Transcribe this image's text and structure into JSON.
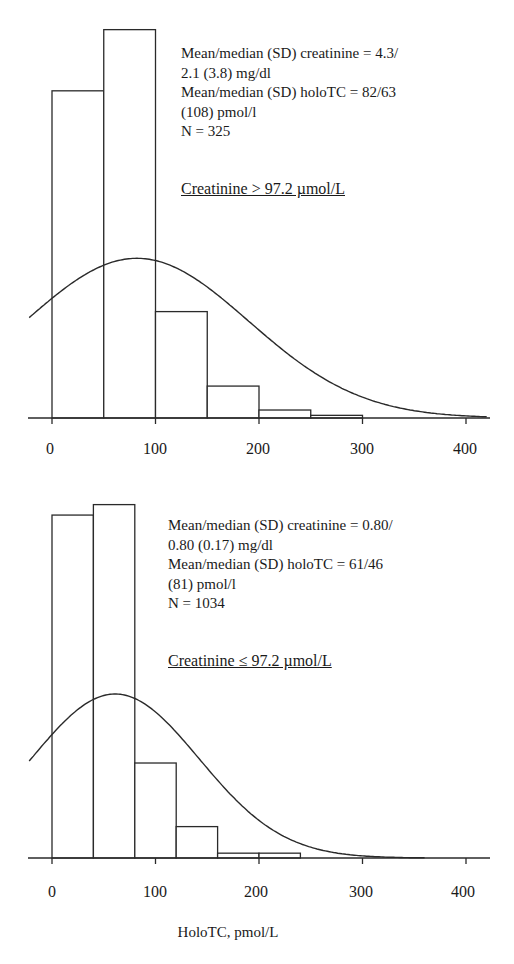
{
  "chart_data": [
    {
      "type": "bar",
      "subtype": "histogram_with_normal_curve",
      "title": "Creatinine > 97.2 µmol/L",
      "xlabel": "",
      "ylabel": "",
      "xlim": [
        -20,
        420
      ],
      "xticks": [
        0,
        100,
        200,
        300,
        400
      ],
      "bin_width": 50,
      "categories": [
        "0-50",
        "50-100",
        "100-150",
        "150-200",
        "200-250",
        "250-300"
      ],
      "bin_starts": [
        0,
        50,
        100,
        150,
        200,
        250
      ],
      "values": [
        123,
        146,
        40,
        12,
        3,
        1
      ],
      "normal_curve": {
        "mean": 82,
        "sd": 108
      },
      "annotations": [
        "Mean/median (SD) creatinine = 4.3/",
        "2.1 (3.8) mg/dl",
        "Mean/median (SD) holoTC = 82/63",
        "(108) pmol/l",
        "N = 325"
      ],
      "grid": false,
      "legend": "none"
    },
    {
      "type": "bar",
      "subtype": "histogram_with_normal_curve",
      "title": "Creatinine ≤ 97.2 µmol/L",
      "xlabel": "HoloTC, pmol/L",
      "ylabel": "",
      "xlim": [
        -20,
        420
      ],
      "xticks": [
        0,
        100,
        200,
        300,
        400
      ],
      "bin_width": 40,
      "categories": [
        "0-40",
        "40-80",
        "80-120",
        "120-160",
        "160-200",
        "200-240"
      ],
      "bin_starts": [
        0,
        40,
        80,
        120,
        160,
        200
      ],
      "values": [
        426,
        439,
        118,
        39,
        6,
        6
      ],
      "normal_curve": {
        "mean": 61,
        "sd": 81
      },
      "annotations": [
        "Mean/median (SD) creatinine = 0.80/",
        "0.80 (0.17) mg/dl",
        "Mean/median (SD) holoTC = 61/46",
        "(81) pmol/l",
        "N = 1034"
      ],
      "grid": false,
      "legend": "none"
    }
  ],
  "top": {
    "stats": [
      "Mean/median (SD) creatinine = 4.3/",
      "2.1 (3.8) mg/dl",
      "Mean/median (SD) holoTC = 82/63",
      "(108) pmol/l",
      "N = 325"
    ],
    "subtitle": "Creatinine > 97.2 µmol/L",
    "ticks": [
      "0",
      "100",
      "200",
      "300",
      "400"
    ]
  },
  "bottom": {
    "stats": [
      "Mean/median (SD) creatinine = 0.80/",
      "0.80 (0.17) mg/dl",
      "Mean/median (SD) holoTC = 61/46",
      "(81) pmol/l",
      "N = 1034"
    ],
    "subtitle": "Creatinine ≤ 97.2 µmol/L",
    "ticks": [
      "0",
      "100",
      "200",
      "300",
      "400"
    ],
    "xlabel": "HoloTC, pmol/L"
  },
  "colors": {
    "line": "#2a2a2a",
    "fill": "#ffffff"
  }
}
